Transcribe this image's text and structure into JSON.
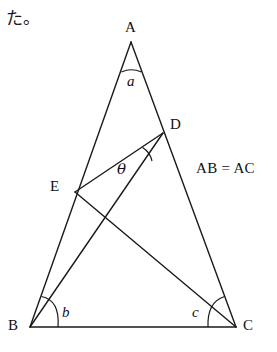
{
  "page": {
    "note_text": "た。",
    "background_color": "#ffffff",
    "stroke_color": "#1a1a1a"
  },
  "figure": {
    "type": "geometry-diagram",
    "condition_text": "AB = AC",
    "vertices": [
      {
        "id": "A",
        "label": "A",
        "x": 131,
        "y": 42,
        "label_x": 125,
        "label_y": 20
      },
      {
        "id": "B",
        "label": "B",
        "x": 30,
        "y": 327,
        "label_x": 8,
        "label_y": 320
      },
      {
        "id": "C",
        "label": "C",
        "x": 236,
        "y": 327,
        "label_x": 243,
        "label_y": 320
      },
      {
        "id": "D",
        "label": "D",
        "x": 163,
        "y": 133,
        "label_x": 170,
        "label_y": 118
      },
      {
        "id": "E",
        "label": "E",
        "x": 75,
        "y": 192,
        "label_x": 50,
        "label_y": 180
      }
    ],
    "segments": [
      {
        "name": "AB",
        "from": "A",
        "to": "B"
      },
      {
        "name": "AC",
        "from": "A",
        "to": "C"
      },
      {
        "name": "BC",
        "from": "B",
        "to": "C"
      },
      {
        "name": "BD",
        "from": "B",
        "to": "D"
      },
      {
        "name": "EC",
        "from": "E",
        "to": "C"
      },
      {
        "name": "ED",
        "from": "E",
        "to": "D"
      }
    ],
    "angles": [
      {
        "id": "a",
        "label": "a",
        "at": "A",
        "label_x": 127,
        "label_y": 75
      },
      {
        "id": "b",
        "label": "b",
        "at": "B",
        "label_x": 60,
        "label_y": 306
      },
      {
        "id": "c",
        "label": "c",
        "at": "C",
        "label_x": 192,
        "label_y": 306
      },
      {
        "id": "theta",
        "label": "θ",
        "at": "D",
        "label_x": 118,
        "label_y": 163
      }
    ]
  }
}
